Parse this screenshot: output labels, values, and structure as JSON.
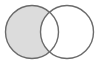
{
  "figure": {
    "width": 102,
    "height": 64,
    "background_color": "#ffffff"
  },
  "chart_data": {
    "type": "venn",
    "title": "",
    "subtitle": "",
    "xlabel": "",
    "ylabel": "",
    "grid": false,
    "legend_position": "none",
    "stroke_color": "#6b6b6b",
    "stroke_width": 1.4,
    "shaded_fill_color": "#dcdcdc",
    "empty_fill_color": "#ffffff",
    "sets": [
      {
        "name": "left-set",
        "label": "",
        "center_x": 32,
        "center_y": 32,
        "radius": 26.5,
        "fill": "#dcdcdc",
        "shaded": true
      },
      {
        "name": "right-set",
        "label": "",
        "center_x": 67,
        "center_y": 32,
        "radius": 26.5,
        "fill": "#ffffff",
        "shaded": false
      }
    ],
    "regions": [
      {
        "name": "left-only",
        "shaded": true,
        "fill": "#dcdcdc"
      },
      {
        "name": "intersection",
        "shaded": true,
        "fill": "#dcdcdc"
      },
      {
        "name": "right-only",
        "shaded": false,
        "fill": "#ffffff"
      }
    ],
    "intersection": {
      "top_point_x": 49,
      "top_point_y": 7,
      "bottom_point_x": 49,
      "bottom_point_y": 57
    },
    "annotations": []
  }
}
